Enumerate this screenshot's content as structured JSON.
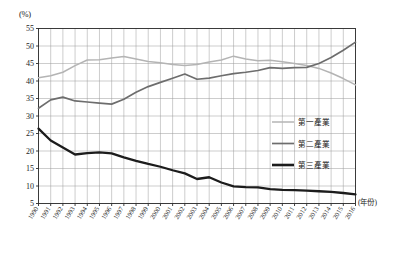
{
  "chart_data": {
    "type": "line",
    "title": "",
    "subtitle": "",
    "xlabel": "(年份)",
    "ylabel": "(%)",
    "ylim": [
      5,
      55
    ],
    "ytick_step": 5,
    "yticks": [
      55,
      50,
      45,
      40,
      35,
      30,
      25,
      20,
      15,
      10,
      5
    ],
    "grid": true,
    "grid_axes": "both",
    "legend_position": "center-right inside plot",
    "x": [
      "1990",
      "1991",
      "1992",
      "1993",
      "1994",
      "1995",
      "1996",
      "1997",
      "1998",
      "1999",
      "2000",
      "2001",
      "2002",
      "2003",
      "2004",
      "2005",
      "2006",
      "2007",
      "2008",
      "2009",
      "2010",
      "2011",
      "2012",
      "2013",
      "2014",
      "2015",
      "2016"
    ],
    "categories": [
      "1990",
      "1991",
      "1992",
      "1993",
      "1994",
      "1995",
      "1996",
      "1997",
      "1998",
      "1999",
      "2000",
      "2001",
      "2002",
      "2003",
      "2004",
      "2005",
      "2006",
      "2007",
      "2008",
      "2009",
      "2010",
      "2011",
      "2012",
      "2013",
      "2014",
      "2015",
      "2016"
    ],
    "series": [
      {
        "name": "第一產業",
        "color": "#b4b4b4",
        "stroke_width": 1.5,
        "values": [
          40.9,
          41.5,
          42.5,
          44.4,
          46.0,
          46.1,
          46.6,
          47.0,
          46.3,
          45.6,
          45.2,
          44.7,
          44.4,
          44.7,
          45.4,
          46.0,
          47.1,
          46.3,
          45.8,
          45.9,
          45.5,
          45.0,
          44.4,
          43.6,
          42.3,
          40.7,
          38.9
        ]
      },
      {
        "name": "第二產業",
        "color": "#6d6d6d",
        "stroke_width": 1.7,
        "values": [
          32.2,
          34.6,
          35.4,
          34.3,
          34.0,
          33.7,
          33.4,
          34.8,
          36.8,
          38.4,
          39.6,
          40.8,
          42.0,
          40.5,
          40.8,
          41.5,
          42.1,
          42.5,
          43.0,
          43.8,
          43.6,
          43.8,
          43.9,
          45.0,
          46.7,
          48.8,
          51.1
        ]
      },
      {
        "name": "第三產業",
        "color": "#1c1c1c",
        "stroke_width": 2.3,
        "values": [
          26.4,
          23.0,
          21.0,
          19.0,
          19.4,
          19.6,
          19.3,
          18.2,
          17.2,
          16.3,
          15.5,
          14.5,
          13.6,
          12.0,
          12.5,
          11.0,
          9.9,
          9.7,
          9.6,
          9.1,
          8.9,
          8.8,
          8.7,
          8.5,
          8.3,
          8.0,
          7.6
        ]
      }
    ]
  },
  "legend": {
    "items": [
      {
        "label": "第一產業",
        "color": "#b4b4b4",
        "width": 1.5
      },
      {
        "label": "第二產業",
        "color": "#6d6d6d",
        "width": 1.7
      },
      {
        "label": "第三產業",
        "color": "#1c1c1c",
        "width": 2.6
      }
    ]
  },
  "axes": {
    "y_unit_label": "(%)",
    "x_unit_label": "(年份)"
  },
  "colors": {
    "grid": "#9a9a9a",
    "frame": "#2b2b2b",
    "background": "#ffffff",
    "text": "#1a1a1a"
  }
}
